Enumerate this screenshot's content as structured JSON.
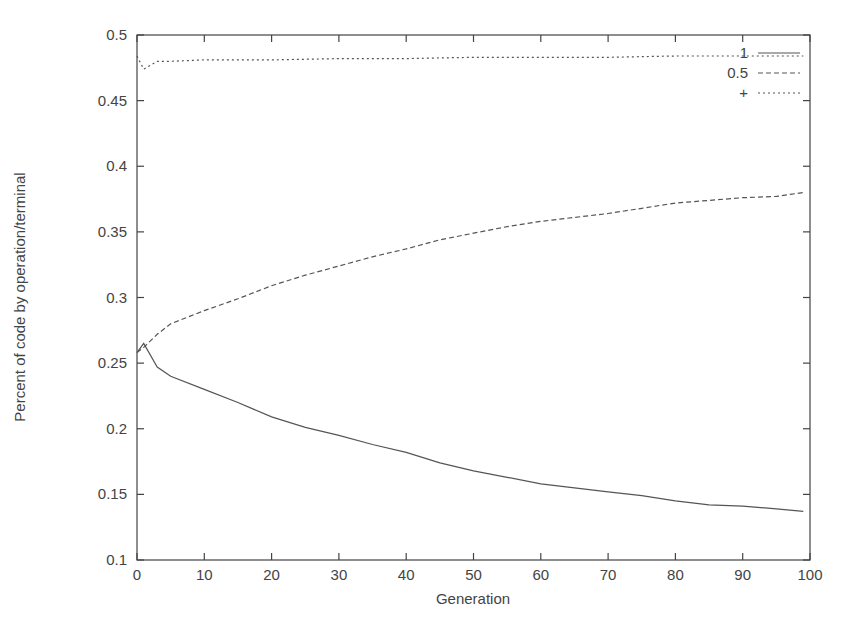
{
  "chart_data": {
    "type": "line",
    "title": "",
    "xlabel": "Generation",
    "ylabel": "Percent of code by operation/terminal",
    "xlim": [
      0,
      100
    ],
    "ylim": [
      0.1,
      0.5
    ],
    "xticks": [
      0,
      10,
      20,
      30,
      40,
      50,
      60,
      70,
      80,
      90,
      100
    ],
    "yticks": [
      0.1,
      0.15,
      0.2,
      0.25,
      0.3,
      0.35,
      0.4,
      0.45,
      0.5
    ],
    "xtick_labels": [
      "0",
      "10",
      "20",
      "30",
      "40",
      "50",
      "60",
      "70",
      "80",
      "90",
      "100"
    ],
    "ytick_labels": [
      "0.1",
      "0.15",
      "0.2",
      "0.25",
      "0.3",
      "0.35",
      "0.4",
      "0.45",
      "0.5"
    ],
    "grid": false,
    "legend_position": "top-right",
    "series": [
      {
        "name": "1",
        "style": "solid",
        "x": [
          0,
          1,
          3,
          5,
          10,
          15,
          20,
          25,
          30,
          35,
          40,
          45,
          50,
          55,
          60,
          65,
          70,
          75,
          80,
          85,
          90,
          95,
          99
        ],
        "values": [
          0.258,
          0.265,
          0.247,
          0.24,
          0.23,
          0.22,
          0.209,
          0.201,
          0.195,
          0.188,
          0.182,
          0.174,
          0.168,
          0.163,
          0.158,
          0.155,
          0.152,
          0.149,
          0.145,
          0.142,
          0.141,
          0.139,
          0.137
        ]
      },
      {
        "name": "0.5",
        "style": "dashed",
        "x": [
          0,
          1,
          3,
          5,
          10,
          15,
          20,
          25,
          30,
          35,
          40,
          45,
          50,
          55,
          60,
          65,
          70,
          75,
          80,
          85,
          90,
          95,
          99
        ],
        "values": [
          0.258,
          0.262,
          0.272,
          0.28,
          0.29,
          0.299,
          0.309,
          0.317,
          0.324,
          0.331,
          0.337,
          0.344,
          0.349,
          0.354,
          0.358,
          0.361,
          0.364,
          0.368,
          0.372,
          0.374,
          0.376,
          0.377,
          0.38
        ]
      },
      {
        "name": "+",
        "style": "dotted",
        "x": [
          0,
          1,
          2,
          3,
          5,
          10,
          20,
          30,
          40,
          50,
          60,
          70,
          80,
          90,
          99
        ],
        "values": [
          0.484,
          0.474,
          0.477,
          0.48,
          0.48,
          0.481,
          0.481,
          0.482,
          0.482,
          0.483,
          0.483,
          0.483,
          0.484,
          0.484,
          0.484
        ]
      }
    ]
  },
  "colors": {
    "axis": "#444444",
    "line": "#555555",
    "background": "#ffffff"
  }
}
